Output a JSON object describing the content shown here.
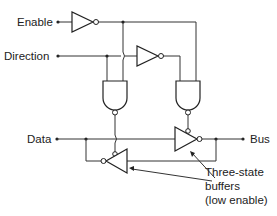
{
  "diagram": {
    "inputs": [
      {
        "id": "enable",
        "label": "Enable"
      },
      {
        "id": "direction",
        "label": "Direction"
      },
      {
        "id": "data",
        "label": "Data"
      }
    ],
    "outputs": [
      {
        "id": "bus",
        "label": "Bus"
      }
    ],
    "components": [
      {
        "id": "inv-enable",
        "type": "NOT",
        "input": "Enable"
      },
      {
        "id": "inv-direction",
        "type": "NOT",
        "input": "Direction"
      },
      {
        "id": "and-left",
        "type": "AND",
        "inputs": [
          "Direction",
          "Enable (inverted)"
        ],
        "output": "inverted, enables lower buffer"
      },
      {
        "id": "and-right",
        "type": "AND",
        "inputs": [
          "Direction (inverted)",
          "Enable (inverted)"
        ],
        "output": "inverted, enables upper buffer"
      },
      {
        "id": "buf-data-to-bus",
        "type": "three-state buffer (low enable)",
        "from": "Data",
        "to": "Bus"
      },
      {
        "id": "buf-bus-to-data",
        "type": "three-state buffer (low enable)",
        "from": "Bus",
        "to": "Data"
      }
    ],
    "annotation": {
      "line1": "Three-state",
      "line2": "buffers",
      "line3": "(low enable)"
    }
  },
  "colors": {
    "line": "#333333",
    "background": "#ffffff"
  }
}
